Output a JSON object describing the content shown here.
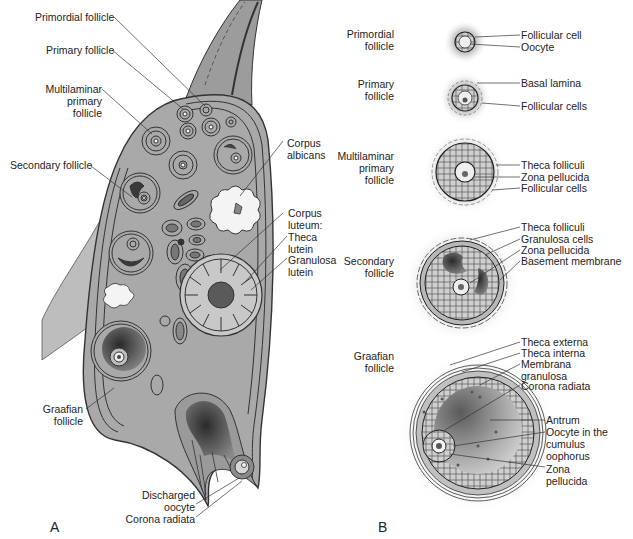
{
  "panels": {
    "a": {
      "letter": "A",
      "labels": {
        "primordial_follicle": "Primordial follicle",
        "primary_follicle": "Primary follicle",
        "multilaminar_primary_follicle": "Multilaminar\nprimary\nfollicle",
        "secondary_follicle": "Secondary follicle",
        "corpus_albicans": "Corpus\nalbicans",
        "corpus_luteum": "Corpus\nluteum:",
        "theca_lutein": "Theca\nlutein",
        "granulosa_lutein": "Granulosa\nlutein",
        "graafian_follicle": "Graafian\nfollicle",
        "discharged_oocyte": "Discharged\noocyte",
        "corona_radiata": "Corona radiata"
      }
    },
    "b": {
      "letter": "B",
      "stages": [
        {
          "name": "Primordial\nfollicle",
          "parts": [
            "Follicular cell",
            "Oocyte"
          ]
        },
        {
          "name": "Primary\nfollicle",
          "parts": [
            "Basal lamina",
            "Follicular cells"
          ]
        },
        {
          "name": "Multilaminar\nprimary\nfollicle",
          "parts": [
            "Theca folliculi",
            "Zona pellucida",
            "Follicular cells"
          ]
        },
        {
          "name": "Secondary\nfollicle",
          "parts": [
            "Theca folliculi",
            "Granulosa cells",
            "Zona pellucida",
            "Basement membrane"
          ]
        },
        {
          "name": "Graafian\nfollicle",
          "parts": [
            "Theca externa",
            "Theca interna",
            "Membrana\ngranulosa",
            "Corona radiata",
            "Antrum",
            "Oocyte in the\ncumulus\noophorus",
            "Zona\npellucida"
          ]
        }
      ]
    }
  },
  "colors": {
    "tissue": "#a9a9a9",
    "tissue_light": "#c4c4c4",
    "outline": "#333333",
    "dark": "#3a3a3a",
    "white_blob": "#f4f4f4"
  }
}
